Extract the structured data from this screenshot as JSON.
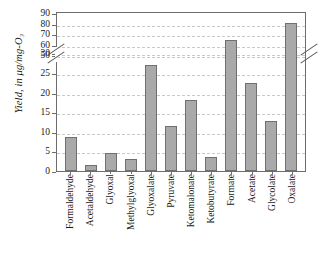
{
  "chart_data": {
    "type": "bar",
    "title": "",
    "xlabel": "",
    "ylabel": "Yield, in μg/mg-O₃",
    "ylabel_parts": {
      "prefix": "Yield, in ",
      "units": "μg/mg-O₃"
    },
    "categories": [
      "Formaldehyde",
      "Acetaldehyde",
      "Glyoxal",
      "Methylglyoxal",
      "Glyoxalate",
      "Pyruvate",
      "Ketomalonate",
      "Ketobutyrate",
      "Formate",
      "Acetate",
      "Glycolate",
      "Oxalate"
    ],
    "values": [
      8.7,
      1.5,
      4.5,
      3.1,
      27.0,
      11.6,
      18.0,
      3.7,
      65.0,
      22.5,
      12.7,
      81.0
    ],
    "ylim": [
      0,
      90
    ],
    "axis_break": {
      "present": true,
      "lower_max": 30,
      "upper_min": 50
    },
    "ytick_labels_lower": [
      "0",
      "5",
      "10",
      "15",
      "20",
      "25",
      "30"
    ],
    "ytick_values_lower": [
      0,
      5,
      10,
      15,
      20,
      25,
      30
    ],
    "ytick_labels_upper": [
      "50",
      "60",
      "70",
      "80",
      "90"
    ],
    "ytick_values_upper": [
      50,
      60,
      70,
      80,
      90
    ],
    "grid": true,
    "grid_style": "dashed",
    "legend": "none",
    "bar_color": "#a9a9a9",
    "bar_border_color": "#707070",
    "grid_color": "#c9c9c9",
    "axis_color": "#6d6d6d",
    "plot_background": "#ffffff"
  }
}
